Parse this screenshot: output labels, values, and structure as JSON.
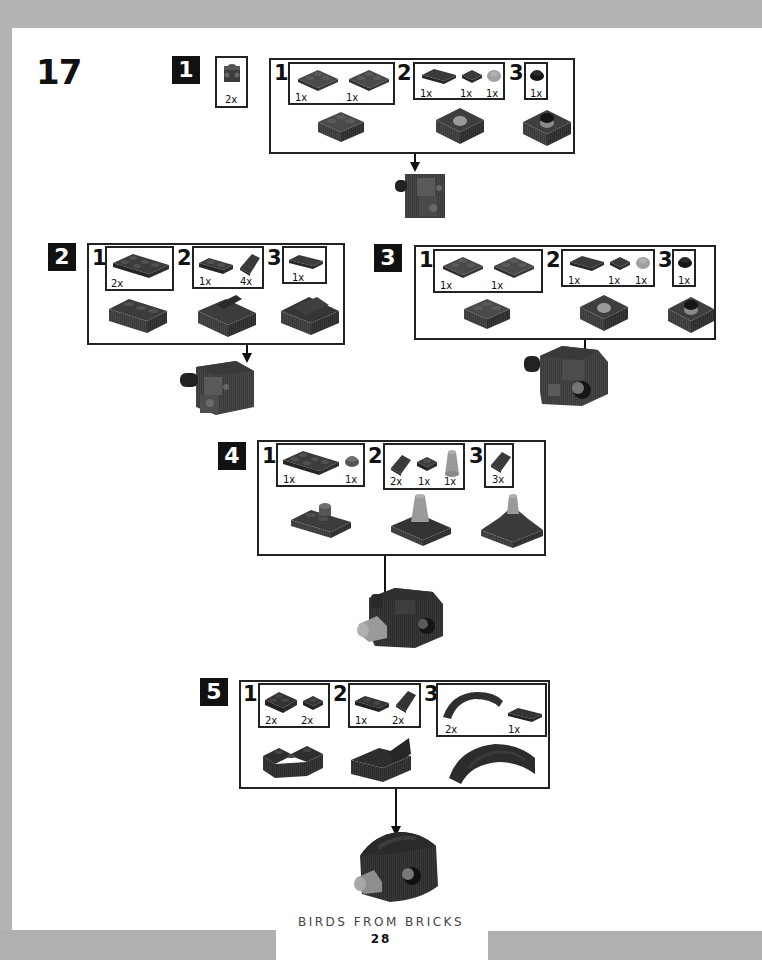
{
  "model_number": "17",
  "footer": {
    "book_title": "BIRDS FROM BRICKS",
    "page_number": "28"
  },
  "colors": {
    "brick_dark": "#3a3a3a",
    "brick_mid": "#555555",
    "brick_light": "#9a9a9a",
    "frame": "#222222",
    "border_gray": "#b4b4b4"
  },
  "steps": [
    {
      "number": "1",
      "parts_callout": {
        "qty": "2x",
        "part": "brick-1x1-with-side-studs"
      },
      "substeps": [
        {
          "number": "1",
          "parts": [
            {
              "qty": "1x",
              "part": "plate-2x2"
            },
            {
              "qty": "1x",
              "part": "plate-2x2"
            }
          ]
        },
        {
          "number": "2",
          "parts": [
            {
              "qty": "1x",
              "part": "tile-1x2"
            },
            {
              "qty": "1x",
              "part": "tile-1x1"
            },
            {
              "qty": "1x",
              "part": "round-plate-1x1-light"
            }
          ]
        },
        {
          "number": "3",
          "parts": [
            {
              "qty": "1x",
              "part": "round-plate-1x1-black"
            }
          ]
        }
      ]
    },
    {
      "number": "2",
      "substeps": [
        {
          "number": "1",
          "parts": [
            {
              "qty": "2x",
              "part": "plate-2x3"
            }
          ]
        },
        {
          "number": "2",
          "parts": [
            {
              "qty": "1x",
              "part": "plate-1x2"
            },
            {
              "qty": "4x",
              "part": "slope-1x1"
            }
          ]
        },
        {
          "number": "3",
          "parts": [
            {
              "qty": "1x",
              "part": "tile-1x2"
            }
          ]
        }
      ]
    },
    {
      "number": "3",
      "substeps": [
        {
          "number": "1",
          "parts": [
            {
              "qty": "1x",
              "part": "plate-2x2"
            },
            {
              "qty": "1x",
              "part": "plate-2x2"
            }
          ]
        },
        {
          "number": "2",
          "parts": [
            {
              "qty": "1x",
              "part": "tile-1x2"
            },
            {
              "qty": "1x",
              "part": "tile-1x1"
            },
            {
              "qty": "1x",
              "part": "round-plate-1x1-light"
            }
          ]
        },
        {
          "number": "3",
          "parts": [
            {
              "qty": "1x",
              "part": "round-plate-1x1-black"
            }
          ]
        }
      ]
    },
    {
      "number": "4",
      "substeps": [
        {
          "number": "1",
          "parts": [
            {
              "qty": "1x",
              "part": "plate-2x3"
            },
            {
              "qty": "1x",
              "part": "round-plate-1x1"
            }
          ]
        },
        {
          "number": "2",
          "parts": [
            {
              "qty": "2x",
              "part": "slope-1x1"
            },
            {
              "qty": "1x",
              "part": "plate-1x1"
            },
            {
              "qty": "1x",
              "part": "cone-1x1-light"
            }
          ]
        },
        {
          "number": "3",
          "parts": [
            {
              "qty": "3x",
              "part": "slope-1x1"
            }
          ]
        }
      ]
    },
    {
      "number": "5",
      "substeps": [
        {
          "number": "1",
          "parts": [
            {
              "qty": "2x",
              "part": "corner-plate"
            },
            {
              "qty": "2x",
              "part": "plate-1x1"
            }
          ]
        },
        {
          "number": "2",
          "parts": [
            {
              "qty": "1x",
              "part": "plate-1x2"
            },
            {
              "qty": "2x",
              "part": "slope-1x1"
            }
          ]
        },
        {
          "number": "3",
          "parts": [
            {
              "qty": "2x",
              "part": "curved-slope-arch"
            },
            {
              "qty": "1x",
              "part": "tile-1x2"
            }
          ]
        }
      ]
    }
  ]
}
